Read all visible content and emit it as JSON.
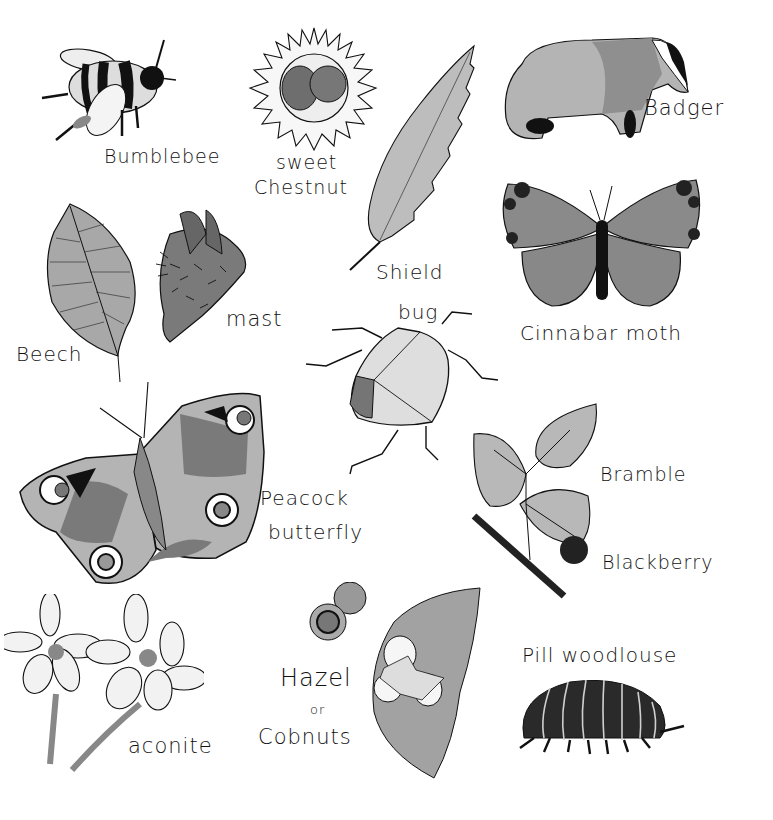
{
  "page": {
    "background": "#ffffff"
  },
  "colors": {
    "ink": "#111111",
    "light_gray": "#c4c4c4",
    "mid_gray": "#9a9a9a",
    "dark_gray": "#6e6e6e",
    "black": "#1a1a1a"
  },
  "items": [
    {
      "id": "bumblebee",
      "label": "Bumblebee"
    },
    {
      "id": "sweet-chestnut",
      "label": "sweet",
      "label2": "Chestnut"
    },
    {
      "id": "badger",
      "label": "Badger"
    },
    {
      "id": "beech",
      "label": "Beech"
    },
    {
      "id": "mast",
      "label": "mast"
    },
    {
      "id": "shield-bug",
      "label": "Shield",
      "label2": "bug"
    },
    {
      "id": "cinnabar-moth",
      "label": "Cinnabar moth"
    },
    {
      "id": "peacock-butterfly",
      "label": "Peacock",
      "label2": "butterfly"
    },
    {
      "id": "bramble",
      "label": "Bramble"
    },
    {
      "id": "blackberry",
      "label": "Blackberry"
    },
    {
      "id": "aconite",
      "label": "aconite"
    },
    {
      "id": "hazel",
      "label": "Hazel",
      "label2": "or",
      "label3": "Cobnuts"
    },
    {
      "id": "pill-woodlouse",
      "label": "Pill woodlouse"
    }
  ]
}
